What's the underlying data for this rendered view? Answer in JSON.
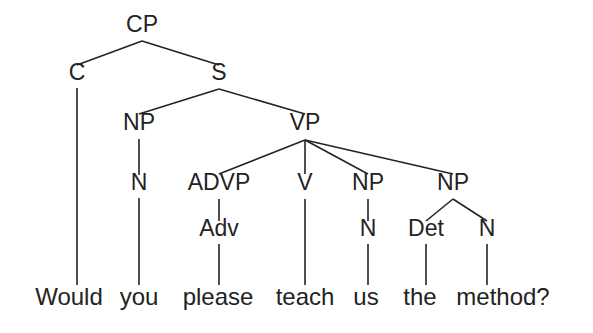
{
  "figure": {
    "type": "syntax-tree",
    "sentence": "Would you please teach us the method?",
    "background_color": "#ffffff",
    "ink_color": "#232323"
  },
  "nodes": {
    "cp": {
      "label": "CP",
      "x": 142,
      "y": 32
    },
    "c": {
      "label": "C",
      "x": 77,
      "y": 80
    },
    "s": {
      "label": "S",
      "x": 219,
      "y": 80
    },
    "np1": {
      "label": "NP",
      "x": 139,
      "y": 130
    },
    "vp": {
      "label": "VP",
      "x": 305,
      "y": 130
    },
    "n1": {
      "label": "N",
      "x": 139,
      "y": 190
    },
    "advp": {
      "label": "ADVP",
      "x": 219,
      "y": 190
    },
    "v": {
      "label": "V",
      "x": 305,
      "y": 190
    },
    "np2": {
      "label": "NP",
      "x": 368,
      "y": 190
    },
    "np3": {
      "label": "NP",
      "x": 453,
      "y": 190
    },
    "adv": {
      "label": "Adv",
      "x": 219,
      "y": 236
    },
    "n2": {
      "label": "N",
      "x": 368,
      "y": 236
    },
    "det": {
      "label": "Det",
      "x": 426,
      "y": 236
    },
    "n3": {
      "label": "N",
      "x": 487,
      "y": 236
    }
  },
  "leaves": [
    {
      "word": "Would",
      "x": 69,
      "y": 305
    },
    {
      "word": "you",
      "x": 139,
      "y": 305
    },
    {
      "word": "please",
      "x": 218,
      "y": 305
    },
    {
      "word": "teach",
      "x": 305,
      "y": 305
    },
    {
      "word": "us",
      "x": 366,
      "y": 305
    },
    {
      "word": "the",
      "x": 420,
      "y": 305
    },
    {
      "word": "method?",
      "x": 503,
      "y": 305
    }
  ],
  "edges": [
    {
      "name": "cp-to-c",
      "x1": 142,
      "y1": 41,
      "x2": 77,
      "y2": 65
    },
    {
      "name": "cp-to-s",
      "x1": 142,
      "y1": 41,
      "x2": 219,
      "y2": 65
    },
    {
      "name": "c-to-would",
      "x1": 77,
      "y1": 88,
      "x2": 77,
      "y2": 285
    },
    {
      "name": "s-to-np1",
      "x1": 219,
      "y1": 89,
      "x2": 139,
      "y2": 114
    },
    {
      "name": "s-to-vp",
      "x1": 219,
      "y1": 89,
      "x2": 305,
      "y2": 114
    },
    {
      "name": "np1-to-n1",
      "x1": 139,
      "y1": 139,
      "x2": 139,
      "y2": 175
    },
    {
      "name": "n1-to-you",
      "x1": 139,
      "y1": 198,
      "x2": 139,
      "y2": 285
    },
    {
      "name": "vp-to-advp",
      "x1": 305,
      "y1": 140,
      "x2": 219,
      "y2": 174
    },
    {
      "name": "vp-to-v",
      "x1": 305,
      "y1": 140,
      "x2": 305,
      "y2": 174
    },
    {
      "name": "vp-to-np2",
      "x1": 305,
      "y1": 140,
      "x2": 368,
      "y2": 174
    },
    {
      "name": "vp-to-np3",
      "x1": 305,
      "y1": 140,
      "x2": 453,
      "y2": 174
    },
    {
      "name": "advp-to-adv",
      "x1": 219,
      "y1": 199,
      "x2": 219,
      "y2": 221
    },
    {
      "name": "adv-to-please",
      "x1": 219,
      "y1": 244,
      "x2": 219,
      "y2": 285
    },
    {
      "name": "v-to-teach",
      "x1": 305,
      "y1": 199,
      "x2": 305,
      "y2": 285
    },
    {
      "name": "np2-to-n2",
      "x1": 368,
      "y1": 199,
      "x2": 368,
      "y2": 221
    },
    {
      "name": "n2-to-us",
      "x1": 368,
      "y1": 244,
      "x2": 368,
      "y2": 285
    },
    {
      "name": "np3-to-det",
      "x1": 453,
      "y1": 199,
      "x2": 426,
      "y2": 221
    },
    {
      "name": "np3-to-n3",
      "x1": 453,
      "y1": 199,
      "x2": 487,
      "y2": 221
    },
    {
      "name": "det-to-the",
      "x1": 426,
      "y1": 244,
      "x2": 426,
      "y2": 285
    },
    {
      "name": "n3-to-method",
      "x1": 487,
      "y1": 244,
      "x2": 487,
      "y2": 285
    }
  ]
}
